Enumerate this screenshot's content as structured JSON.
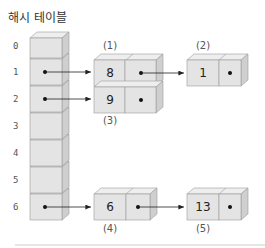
{
  "title": "해시 테이블",
  "hash_table": {
    "indices": [
      "0",
      "1",
      "2",
      "3",
      "4",
      "5",
      "6"
    ],
    "pointers": [
      false,
      true,
      true,
      false,
      false,
      false,
      true
    ]
  },
  "nodes": [
    {
      "label": "(1)",
      "value": "8",
      "has_next": true
    },
    {
      "label": "(2)",
      "value": "1",
      "has_next": false
    },
    {
      "label": "(3)",
      "value": "9",
      "has_next": false
    },
    {
      "label": "(4)",
      "value": "6",
      "has_next": true
    },
    {
      "label": "(5)",
      "value": "13",
      "has_next": false
    }
  ],
  "colors": {
    "cell_front": "#e4e4e4",
    "cell_top": "#eeeeee",
    "cell_side": "#cfcfcf",
    "stroke": "#9a9a9a",
    "divider": "#cccccc"
  }
}
